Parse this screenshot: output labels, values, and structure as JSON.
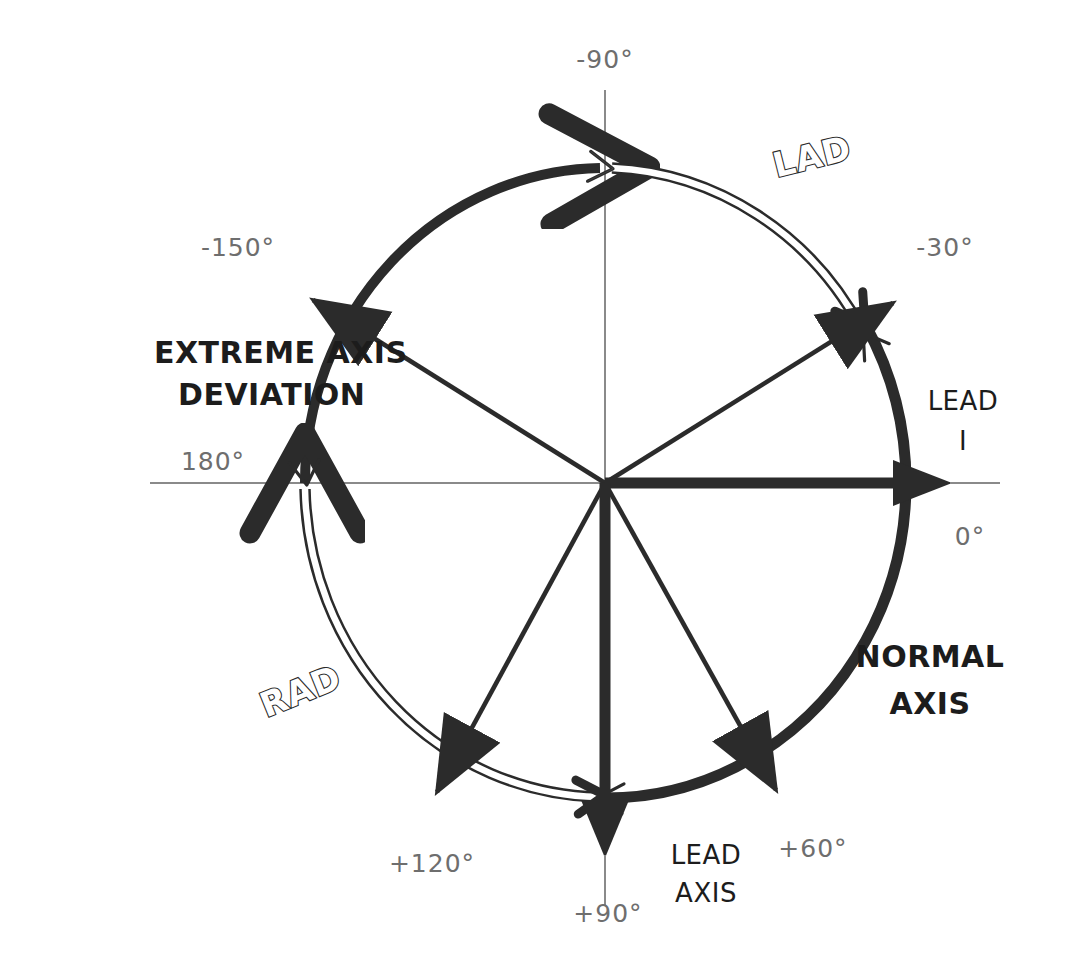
{
  "diagram": {
    "center": {
      "x": 605,
      "y": 483
    },
    "radius": {
      "x": 300,
      "y": 315
    },
    "colors": {
      "ink": "#2b2b2b",
      "thin_axis": "#8a8a8a",
      "degree_text": "#6e6e6e",
      "bold_text": "#1c1c1c",
      "background": "#ffffff"
    },
    "degree_labels": [
      {
        "id": "deg-minus-90",
        "text": "-90°",
        "x": 605,
        "y": 68,
        "anchor": "middle"
      },
      {
        "id": "deg-minus-150",
        "text": "-150°",
        "x": 238,
        "y": 256,
        "anchor": "middle"
      },
      {
        "id": "deg-minus-30",
        "text": "-30°",
        "x": 945,
        "y": 256,
        "anchor": "middle"
      },
      {
        "id": "deg-180",
        "text": "180°",
        "x": 213,
        "y": 470,
        "anchor": "middle"
      },
      {
        "id": "deg-0",
        "text": "0°",
        "x": 970,
        "y": 545,
        "anchor": "middle"
      },
      {
        "id": "deg-plus-120",
        "text": "+120°",
        "x": 432,
        "y": 872,
        "anchor": "middle"
      },
      {
        "id": "deg-plus-90",
        "text": "+90°",
        "x": 608,
        "y": 922,
        "anchor": "middle"
      },
      {
        "id": "deg-plus-60",
        "text": "+60°",
        "x": 813,
        "y": 857,
        "anchor": "middle"
      }
    ],
    "text_labels": [
      {
        "id": "lad",
        "text": "LAD",
        "style": "outline",
        "x": 815,
        "y": 168,
        "rotate": -14
      },
      {
        "id": "rad",
        "text": "RAD",
        "style": "outline",
        "x": 305,
        "y": 702,
        "rotate": -22
      },
      {
        "id": "extreme-1",
        "text": "EXTREME AXIS",
        "style": "bold",
        "x": 154,
        "y": 363,
        "rotate": 0
      },
      {
        "id": "extreme-2",
        "text": "DEVIATION",
        "style": "bold",
        "x": 154,
        "y": 405,
        "rotate": 0
      },
      {
        "id": "normal-1",
        "text": "NORMAL",
        "style": "bold",
        "x": 930,
        "y": 667,
        "rotate": 0
      },
      {
        "id": "normal-2",
        "text": "AXIS",
        "style": "bold",
        "x": 930,
        "y": 714,
        "rotate": 0
      },
      {
        "id": "lead-i-1",
        "text": "LEAD",
        "style": "plain",
        "x": 963,
        "y": 410,
        "rotate": 0
      },
      {
        "id": "lead-i-2",
        "text": "I",
        "style": "plain",
        "x": 963,
        "y": 448,
        "rotate": 0
      },
      {
        "id": "lead-axis-1",
        "text": "LEAD",
        "style": "plain",
        "x": 706,
        "y": 864,
        "rotate": 0
      },
      {
        "id": "lead-axis-2",
        "text": "AXIS",
        "style": "plain",
        "x": 706,
        "y": 900,
        "rotate": 0
      }
    ],
    "arcs": [
      {
        "id": "normal-axis-arc",
        "label": "NORMAL AXIS",
        "from_deg": -30,
        "to_deg": 90,
        "style": "solid",
        "note": "thick solid arc sweeping right side of circle"
      },
      {
        "id": "extreme-arc",
        "label": "EXTREME AXIS DEVIATION",
        "from_deg": -90,
        "to_deg": 180,
        "style": "solid",
        "note": "thick solid arc upper-left quadrant"
      },
      {
        "id": "lad-arc",
        "label": "LAD",
        "from_deg": -30,
        "to_deg": -90,
        "style": "outline",
        "note": "double-line arc from -30 to -90"
      },
      {
        "id": "rad-arc",
        "label": "RAD",
        "from_deg": 90,
        "to_deg": 180,
        "style": "outline",
        "note": "double-line arc from +90 to 180"
      }
    ],
    "rays": [
      {
        "id": "ray-lead-i",
        "angle_deg": 0,
        "weight": "heavy",
        "arrow": "filled-large",
        "label": "LEAD I / 0°"
      },
      {
        "id": "ray-90",
        "angle_deg": 90,
        "weight": "heavy",
        "arrow": "filled-large",
        "label": "LEAD AXIS / +90°"
      },
      {
        "id": "ray-minus-30",
        "angle_deg": -30,
        "weight": "thin",
        "arrow": "filled",
        "label": "-30°"
      },
      {
        "id": "ray-minus-150",
        "angle_deg": -150,
        "weight": "thin",
        "arrow": "filled",
        "label": "-150°"
      },
      {
        "id": "ray-plus-60",
        "angle_deg": 60,
        "weight": "thin",
        "arrow": "filled",
        "label": "+60°"
      },
      {
        "id": "ray-plus-120",
        "angle_deg": 120,
        "weight": "thin",
        "arrow": "filled",
        "label": "+120°"
      }
    ],
    "thin_axes": [
      {
        "id": "horizontal-axis",
        "x1": 150,
        "y1": 483,
        "x2": 1000,
        "y2": 483
      },
      {
        "id": "vertical-axis",
        "x1": 605,
        "y1": 90,
        "x2": 605,
        "y2": 905
      }
    ]
  }
}
